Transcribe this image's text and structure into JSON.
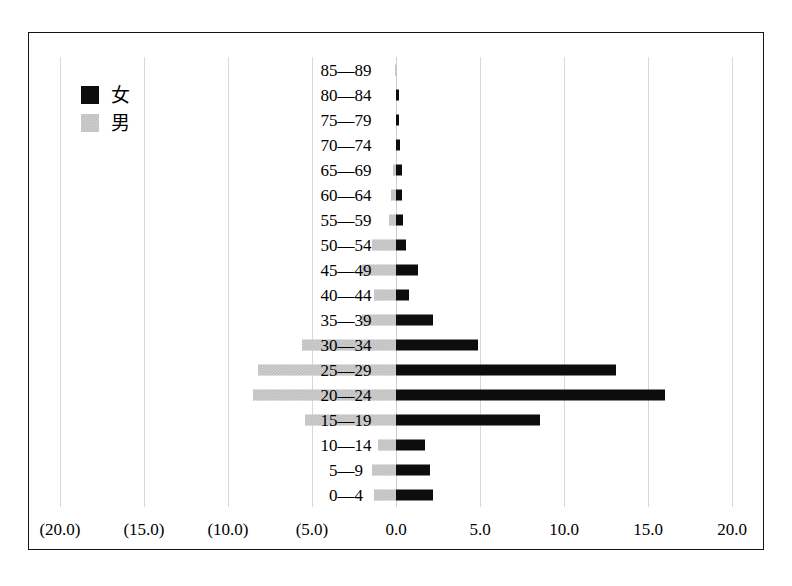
{
  "legend": {
    "position": "top-left",
    "entries": [
      {
        "label": "女",
        "meaning": "female",
        "color": "#0d0d0d"
      },
      {
        "label": "男",
        "meaning": "male",
        "color": "#cfcfcf"
      }
    ]
  },
  "axis": {
    "x_ticks": [
      "(20.0)",
      "(15.0)",
      "(10.0)",
      "(5.0)",
      "0.0",
      "5.0",
      "10.0",
      "15.0",
      "20.0"
    ],
    "x_tick_values": [
      -20,
      -15,
      -10,
      -5,
      0,
      5,
      10,
      15,
      20
    ],
    "grid": true
  },
  "chart_data": {
    "type": "bar",
    "subtype": "population-pyramid",
    "title": "",
    "xlabel": "",
    "ylabel": "",
    "xlim": [
      -20,
      20
    ],
    "grid": true,
    "legend_position": "top-left",
    "categories": [
      "85—89",
      "80—84",
      "75—79",
      "70—74",
      "65—69",
      "60—64",
      "55—59",
      "50—54",
      "45—49",
      "40—44",
      "35—39",
      "30—34",
      "25—29",
      "20—24",
      "15—19",
      "10—14",
      "5—9",
      "0—4"
    ],
    "series": [
      {
        "name": "女",
        "side": "right",
        "color": "#0d0d0d",
        "values": [
          0.0,
          0.2,
          0.2,
          0.25,
          0.35,
          0.35,
          0.4,
          0.6,
          1.3,
          0.75,
          2.2,
          4.9,
          13.1,
          16.0,
          8.6,
          1.7,
          2.0,
          2.2
        ]
      },
      {
        "name": "男",
        "side": "left",
        "color": "#cfcfcf",
        "values": [
          0.05,
          0.0,
          0.0,
          0.0,
          0.15,
          0.3,
          0.4,
          1.4,
          2.0,
          1.3,
          2.0,
          5.6,
          8.2,
          8.5,
          5.4,
          1.1,
          1.4,
          1.3
        ]
      }
    ]
  }
}
